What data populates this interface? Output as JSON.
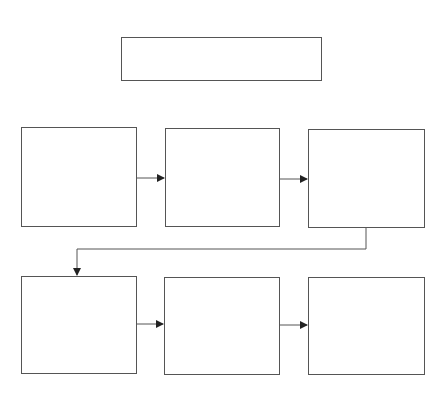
{
  "diagram": {
    "title_box": {
      "label": ""
    },
    "row1": [
      {
        "label": ""
      },
      {
        "label": ""
      },
      {
        "label": ""
      }
    ],
    "row2": [
      {
        "label": ""
      },
      {
        "label": ""
      },
      {
        "label": ""
      }
    ],
    "colors": {
      "stroke": "#555555",
      "arrow": "#222222",
      "background": "#ffffff"
    }
  }
}
